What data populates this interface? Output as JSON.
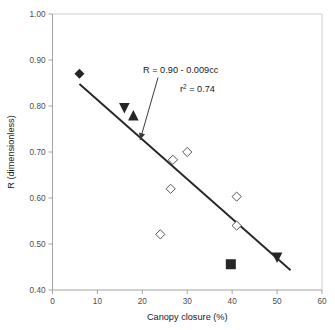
{
  "chart_data": {
    "type": "scatter",
    "title": "",
    "xlabel": "Canopy closure (%)",
    "ylabel": "R (dimensionless)",
    "xlim": [
      0,
      60
    ],
    "ylim": [
      0.4,
      1.0
    ],
    "xticks": [
      "0",
      "10",
      "20",
      "30",
      "40",
      "50",
      "60"
    ],
    "xtick_values": [
      0,
      10,
      20,
      30,
      40,
      50,
      60
    ],
    "yticks": [
      "0.40",
      "0.50",
      "0.60",
      "0.70",
      "0.80",
      "0.90",
      "1.00"
    ],
    "ytick_values": [
      0.4,
      0.5,
      0.6,
      0.7,
      0.8,
      0.9,
      1.0
    ],
    "grid": false,
    "legend": "none",
    "annotations": [
      {
        "name": "equation",
        "text": "R = 0.90 - 0.009cc"
      },
      {
        "name": "r-squared",
        "text_prefix": "r",
        "text_sup": "2",
        "text_suffix": " = 0.74"
      }
    ],
    "trendline": {
      "equation": "R = 0.90 - 0.009cc",
      "intercept": 0.9,
      "slope": -0.009,
      "r_squared": 0.74,
      "x_start": 6,
      "y_start": 0.848,
      "x_end": 53,
      "y_end": 0.443
    },
    "arrow": {
      "from_x": 23.5,
      "from_y": 0.862,
      "to_x": 19.5,
      "to_y": 0.726
    },
    "series": [
      {
        "name": "filled-diamond",
        "marker": "diamond-filled",
        "points": [
          {
            "x": 6,
            "y": 0.87
          }
        ]
      },
      {
        "name": "filled-down-triangle",
        "marker": "triangle-down-filled",
        "points": [
          {
            "x": 16,
            "y": 0.795
          },
          {
            "x": 50,
            "y": 0.47
          }
        ]
      },
      {
        "name": "filled-up-triangle",
        "marker": "triangle-up-filled",
        "points": [
          {
            "x": 18,
            "y": 0.78
          }
        ]
      },
      {
        "name": "filled-square",
        "marker": "square-filled",
        "points": [
          {
            "x": 39.7,
            "y": 0.456
          }
        ]
      },
      {
        "name": "open-diamond",
        "marker": "diamond-open",
        "points": [
          {
            "x": 26.8,
            "y": 0.683
          },
          {
            "x": 30.0,
            "y": 0.7
          },
          {
            "x": 26.3,
            "y": 0.62
          },
          {
            "x": 24.0,
            "y": 0.521
          },
          {
            "x": 41.0,
            "y": 0.603
          },
          {
            "x": 41.0,
            "y": 0.54
          }
        ]
      }
    ]
  },
  "colors": {
    "marker_fill": "#262626",
    "marker_open_stroke": "#555555",
    "trendline": "#262626",
    "axis": "#9a9a9a",
    "frame": "#c8c8c8",
    "tick_text": "#4d4d4d",
    "title_text": "#1a1a1a",
    "background": "#ffffff"
  }
}
